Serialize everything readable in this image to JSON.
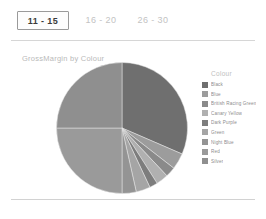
{
  "tabs": [
    {
      "label": "11 - 15",
      "selected": true
    },
    {
      "label": "16 - 20",
      "selected": false
    },
    {
      "label": "26 - 30",
      "selected": false
    }
  ],
  "chart_title": "GrossMargin by Colour",
  "legend": {
    "title": "Colour"
  },
  "chart_data": {
    "type": "pie",
    "title": "GrossMargin by Colour",
    "xlabel": "",
    "ylabel": "",
    "legend_title": "Colour",
    "legend_position": "right",
    "grid": false,
    "start_angle_deg": 0,
    "direction": "clockwise",
    "categories": [
      "Black",
      "Blue",
      "British Racing Green",
      "Canary Yellow",
      "Dark Purple",
      "Green",
      "Night Blue",
      "Red",
      "Silver"
    ],
    "values": [
      31.5,
      4.0,
      2.5,
      3.0,
      2.0,
      3.5,
      3.5,
      25.0,
      25.0
    ],
    "unit": "percent",
    "colors": [
      "#6f6f6f",
      "#9c9c9c",
      "#8a8a8a",
      "#b0b0b0",
      "#7d7d7d",
      "#a5a5a5",
      "#949494",
      "#9a9a9a",
      "#8f8f8f"
    ]
  }
}
